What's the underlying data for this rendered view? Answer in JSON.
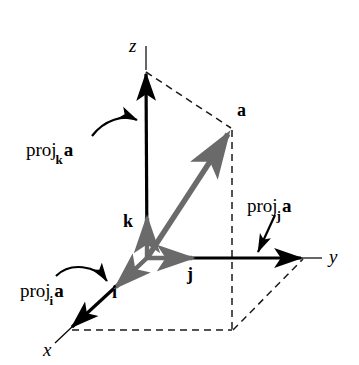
{
  "figure": {
    "background_color": "#ffffff",
    "axis_color": "#000000",
    "vector_color": "#6a6a6a",
    "dashed_color": "#1a1a1a"
  },
  "axes": [
    {
      "name": "z-axis",
      "label": "z",
      "direction": "up"
    },
    {
      "name": "y-axis",
      "label": "y",
      "direction": "right"
    },
    {
      "name": "x-axis",
      "label": "x",
      "direction": "down-left"
    }
  ],
  "axis_labels": {
    "x": "x",
    "y": "y",
    "z": "z"
  },
  "unit_vectors": [
    {
      "name": "i",
      "label": "i",
      "direction": "down-left"
    },
    {
      "name": "j",
      "label": "j",
      "direction": "right"
    },
    {
      "name": "k",
      "label": "k",
      "direction": "up"
    }
  ],
  "unit_labels": {
    "i": "i",
    "j": "j",
    "k": "k"
  },
  "vectors": [
    {
      "name": "a",
      "label": "a",
      "color": "#6a6a6a",
      "from": "origin",
      "to": "tip"
    }
  ],
  "vector_labels": {
    "a": "a"
  },
  "projections": [
    {
      "name": "proj-k-a",
      "base": "proj",
      "subscript": "k",
      "operand": "a",
      "full_text": "proj_k a",
      "pointer": "curved-arrow",
      "target": "z-axis"
    },
    {
      "name": "proj-j-a",
      "base": "proj",
      "subscript": "j",
      "operand": "a",
      "full_text": "proj_j a",
      "pointer": "straight-arrow",
      "target": "y-axis"
    },
    {
      "name": "proj-i-a",
      "base": "proj",
      "subscript": "i",
      "operand": "a",
      "full_text": "proj_i a",
      "pointer": "curved-arrow",
      "target": "x-axis"
    }
  ],
  "projection_labels": {
    "k": {
      "base": "proj",
      "sub": "k",
      "operand": "a"
    },
    "j": {
      "base": "proj",
      "sub": "j",
      "operand": "a"
    },
    "i": {
      "base": "proj",
      "sub": "i",
      "operand": "a"
    }
  },
  "construction_lines": {
    "style": "dashed",
    "description": "dashed box edges connecting the tip of vector a to the z-axis, the y-axis and the xy-plane base rectangle"
  }
}
